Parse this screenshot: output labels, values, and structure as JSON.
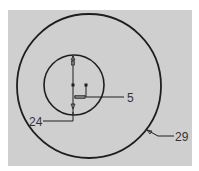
{
  "diagram": {
    "type": "technical-drawing",
    "colors": {
      "background": "#ffffff",
      "panel": "#cfcfcf",
      "stroke": "#1e1e1e",
      "label": "#333333"
    },
    "outer_circle": {
      "cx": 89,
      "cy": 86,
      "r": 72
    },
    "inner_circle": {
      "cx": 74,
      "cy": 85,
      "r": 30
    },
    "labels": [
      {
        "id": "label-5",
        "text": "5",
        "x": 128,
        "y": 103
      },
      {
        "id": "label-24",
        "text": "24",
        "x": 29,
        "y": 127
      },
      {
        "id": "label-29",
        "text": "29",
        "x": 175,
        "y": 141
      }
    ]
  }
}
